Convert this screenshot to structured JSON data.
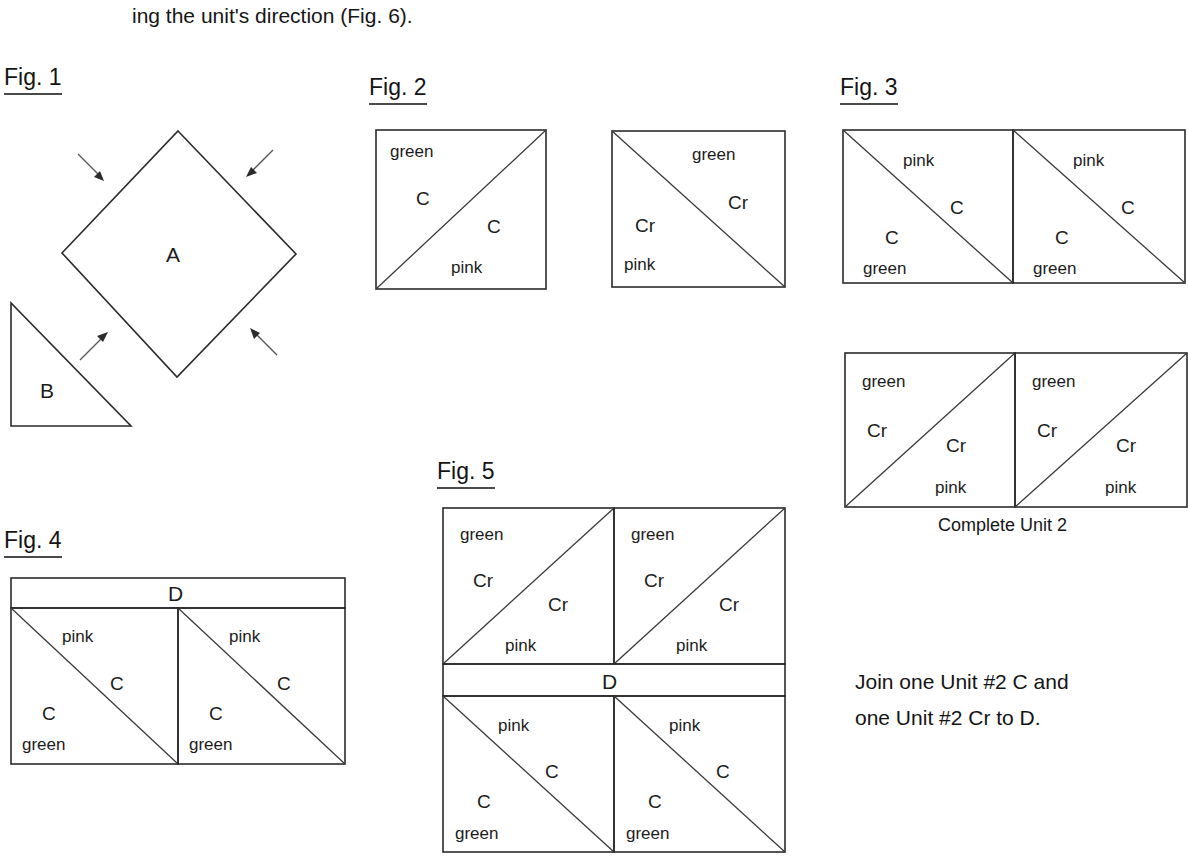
{
  "document": {
    "intro_text": "ing the unit's direction (Fig. 6)."
  },
  "figures": {
    "fig1": {
      "label": "Fig. 1",
      "diamond_label": "A",
      "triangle_label": "B",
      "arrow_count": 4
    },
    "fig2": {
      "label": "Fig. 2",
      "left_square": {
        "diagonal": "bottom-left-to-top-right",
        "upper_fabric": "green",
        "upper_code": "C",
        "lower_fabric": "pink",
        "lower_code": "C"
      },
      "right_square": {
        "diagonal": "top-left-to-bottom-right",
        "upper_fabric": "green",
        "upper_code": "Cr",
        "lower_fabric": "pink",
        "lower_code": "Cr"
      }
    },
    "fig3": {
      "label": "Fig. 3",
      "top_row": [
        {
          "diagonal": "top-left-to-bottom-right",
          "upper_fabric": "pink",
          "upper_code": "C",
          "lower_fabric": "green",
          "lower_code": "C"
        },
        {
          "diagonal": "top-left-to-bottom-right",
          "upper_fabric": "pink",
          "upper_code": "C",
          "lower_fabric": "green",
          "lower_code": "C"
        }
      ],
      "bottom_row": [
        {
          "diagonal": "bottom-left-to-top-right",
          "upper_fabric": "green",
          "upper_code": "Cr",
          "lower_fabric": "pink",
          "lower_code": "Cr"
        },
        {
          "diagonal": "bottom-left-to-top-right",
          "upper_fabric": "green",
          "upper_code": "Cr",
          "lower_fabric": "pink",
          "lower_code": "Cr"
        }
      ],
      "caption": "Complete Unit 2"
    },
    "fig4": {
      "label": "Fig. 4",
      "strip_label": "D",
      "squares": [
        {
          "diagonal": "top-left-to-bottom-right",
          "upper_fabric": "pink",
          "upper_code": "C",
          "lower_fabric": "green",
          "lower_code": "C"
        },
        {
          "diagonal": "top-left-to-bottom-right",
          "upper_fabric": "pink",
          "upper_code": "C",
          "lower_fabric": "green",
          "lower_code": "C"
        }
      ]
    },
    "fig5": {
      "label": "Fig. 5",
      "strip_label": "D",
      "top_squares": [
        {
          "diagonal": "bottom-left-to-top-right",
          "upper_fabric": "green",
          "upper_code": "Cr",
          "lower_fabric": "pink",
          "lower_code": "Cr"
        },
        {
          "diagonal": "bottom-left-to-top-right",
          "upper_fabric": "green",
          "upper_code": "Cr",
          "lower_fabric": "pink",
          "lower_code": "Cr"
        }
      ],
      "bottom_squares": [
        {
          "diagonal": "top-left-to-bottom-right",
          "upper_fabric": "pink",
          "upper_code": "C",
          "lower_fabric": "green",
          "lower_code": "C"
        },
        {
          "diagonal": "top-left-to-bottom-right",
          "upper_fabric": "pink",
          "upper_code": "C",
          "lower_fabric": "green",
          "lower_code": "C"
        }
      ]
    }
  },
  "instructions": {
    "join_line_1": "Join one Unit #2 C and",
    "join_line_2": "one Unit #2 Cr to D."
  },
  "colors": {
    "page_background": "#ffffff",
    "ink": "#1a1a1a",
    "line": "#2b2b2b",
    "arrow": "#555555"
  }
}
